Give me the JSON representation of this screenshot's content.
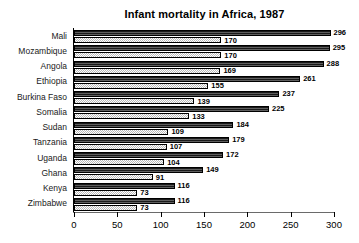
{
  "chart_data": {
    "type": "bar",
    "orientation": "horizontal",
    "title": "Infant mortality in Africa, 1987",
    "xlabel": "",
    "ylabel": "",
    "xlim": [
      0,
      300
    ],
    "grid": false,
    "legend": "none",
    "xticks": [
      0,
      50,
      100,
      150,
      200,
      250,
      300
    ],
    "xtick_labels": [
      "0",
      "50",
      "100",
      "150",
      "200",
      "250",
      "300"
    ],
    "categories": [
      "Mali",
      "Mozambique",
      "Angola",
      "Ethiopia",
      "Burkina Faso",
      "Somalia",
      "Sudan",
      "Tanzania",
      "Uganda",
      "Ghana",
      "Kenya",
      "Zimbabwe"
    ],
    "series": [
      {
        "name": "series-a",
        "style": "dark-hatched",
        "values": [
          296,
          295,
          288,
          261,
          237,
          225,
          184,
          179,
          172,
          149,
          116,
          116
        ],
        "value_labels": [
          "296",
          "295",
          "288",
          "261",
          "237",
          "225",
          "184",
          "179",
          "172",
          "149",
          "116",
          "116"
        ]
      },
      {
        "name": "series-b",
        "style": "light-stippled",
        "values": [
          170,
          170,
          169,
          155,
          139,
          133,
          109,
          107,
          104,
          91,
          73,
          73
        ],
        "value_labels": [
          "170",
          "170",
          "169",
          "155",
          "139",
          "133",
          "109",
          "107",
          "104",
          "91",
          "73",
          "73"
        ]
      }
    ],
    "colors": {
      "series_a_fill": "#1a1a1a",
      "series_b_fill": "#b9b9b9",
      "bar_outline": "#000000",
      "axis": "#000000",
      "text": "#000000",
      "background": "#ffffff"
    }
  }
}
